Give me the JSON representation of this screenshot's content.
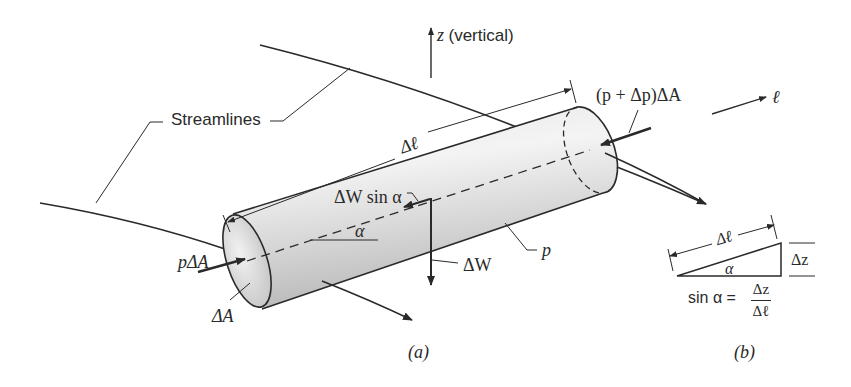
{
  "figure": {
    "labels": {
      "z_axis": "z",
      "z_axis_note": "(vertical)",
      "streamlines": "Streamlines",
      "delta_l": "Δℓ",
      "pressure_right_force": "(p + Δp)ΔA",
      "l_direction": "ℓ",
      "weight_component": "ΔW sin α",
      "alpha": "α",
      "pressure_left_force": "pΔA",
      "weight": "ΔW",
      "pressure": "p",
      "area": "ΔA",
      "caption_a": "(a)",
      "caption_b": "(b)"
    },
    "triangle": {
      "hypotenuse": "Δℓ",
      "angle": "α",
      "rise": "Δz",
      "formula_lhs": "sin α =",
      "formula_num": "Δz",
      "formula_den": "Δℓ"
    }
  },
  "colors": {
    "ink": "#2a2a2a",
    "cylinder_light": "#f2f2f2",
    "cylinder_dark": "#b9b9b9"
  }
}
